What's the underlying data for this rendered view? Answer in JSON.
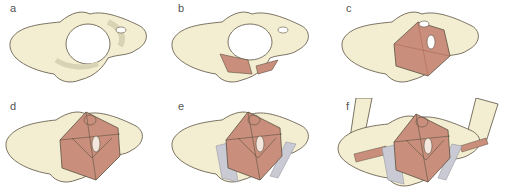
{
  "figure": {
    "panels": [
      {
        "label": "a",
        "content": "bony pelvis"
      },
      {
        "label": "b",
        "content": "bony pelvis with posterior muscles"
      },
      {
        "label": "c",
        "content": "levator ani muscles"
      },
      {
        "label": "d",
        "content": "superficial perineal muscles"
      },
      {
        "label": "e",
        "content": "with ligaments / fascia"
      },
      {
        "label": "f",
        "content": "with femurs and ligaments"
      }
    ],
    "colors": {
      "bone": "#f3eed2",
      "bone_shadow": "#d9d3b6",
      "muscle": "#c98f7c",
      "muscle_dark": "#a86a57",
      "fascia": "#c9cad3",
      "outline": "#5a5040",
      "label": "#555555"
    }
  }
}
